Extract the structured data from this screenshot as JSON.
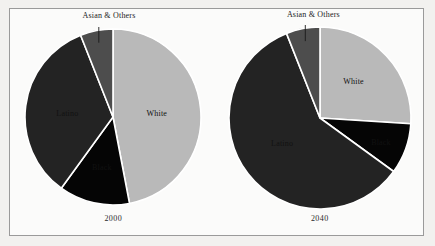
{
  "figure": {
    "background": "#fbfbfa",
    "border_color": "#9a9a9a",
    "callout_label": "Asian & Others"
  },
  "colors": {
    "white_slice": "#b9b9b9",
    "black_slice": "#050505",
    "latino_slice": "#232323",
    "asian_other_slice": "#4d4d4d",
    "separator": "#ffffff",
    "text_dark": "#111111",
    "text_light": "#fafafa"
  },
  "chart_data": [
    {
      "type": "pie",
      "title": "2000",
      "labels": [
        "White",
        "Black",
        "Latino",
        "Asian & Others"
      ],
      "values": [
        47,
        13,
        34,
        6
      ],
      "colors": [
        "#b9b9b9",
        "#050505",
        "#232323",
        "#4d4d4d"
      ],
      "label_colors": [
        "#111111",
        "#fafafa",
        "#fafafa",
        "#111111"
      ],
      "start_angle_deg": 0,
      "direction": "clockwise",
      "legend": "none",
      "annotations": [
        "Asian & Others"
      ]
    },
    {
      "type": "pie",
      "title": "2040",
      "labels": [
        "White",
        "Black",
        "Latino",
        "Asian & Others"
      ],
      "values": [
        26,
        9,
        59,
        6
      ],
      "colors": [
        "#b9b9b9",
        "#050505",
        "#232323",
        "#4d4d4d"
      ],
      "label_colors": [
        "#111111",
        "#fafafa",
        "#fafafa",
        "#111111"
      ],
      "start_angle_deg": 0,
      "direction": "clockwise",
      "legend": "none",
      "annotations": [
        "Asian & Others"
      ]
    }
  ]
}
